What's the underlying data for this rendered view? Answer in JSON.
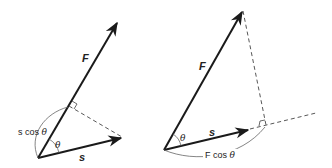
{
  "diagrams": [
    {
      "name": "projection-of-s-onto-F",
      "vectors": [
        {
          "label": "F",
          "from": [
            38,
            158
          ],
          "to": [
            118,
            21
          ]
        },
        {
          "label": "s",
          "from": [
            38,
            158
          ],
          "to": [
            123,
            137
          ]
        }
      ],
      "angle_label": "θ",
      "projection_label": {
        "prefix": "s cos ",
        "symbol": "θ"
      }
    },
    {
      "name": "projection-of-F-onto-s",
      "vectors": [
        {
          "label": "F",
          "from": [
            164,
            150
          ],
          "to": [
            243,
            10
          ]
        },
        {
          "label": "s",
          "from": [
            164,
            150
          ],
          "to": [
            250,
            130
          ]
        }
      ],
      "angle_label": "θ",
      "projection_label": {
        "prefix": "F cos ",
        "symbol": "θ"
      }
    }
  ],
  "colors": {
    "vector": "#1a1a1a",
    "dashed": "#444444",
    "arc": "#666666",
    "text": "#222222"
  }
}
